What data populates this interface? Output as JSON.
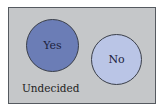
{
  "diagram": {
    "type": "venn",
    "universe_label": "Undecided",
    "sets": [
      {
        "label": "Yes",
        "fill": "#6b7db6"
      },
      {
        "label": "No",
        "fill": "#bac5e6"
      }
    ],
    "background": "#c5c7c9",
    "border": "#555a60"
  }
}
